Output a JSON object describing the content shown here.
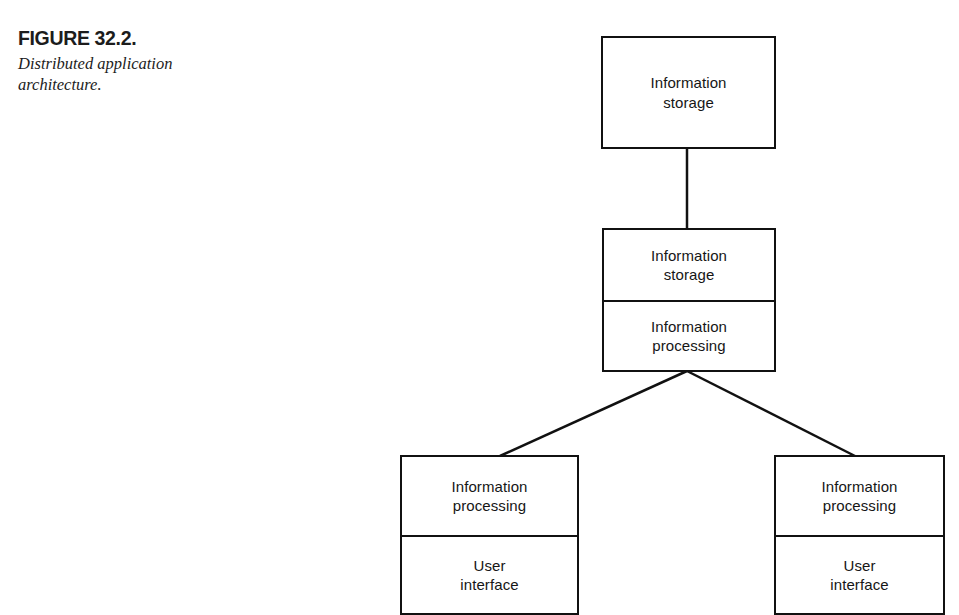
{
  "figure": {
    "label": "FIGURE 32.2.",
    "caption": "Distributed application architecture."
  },
  "diagram": {
    "title": "Distributed application architecture",
    "line_color": "#111111",
    "background": "#ffffff",
    "nodes": [
      {
        "id": "top",
        "name": "information-storage-tier",
        "compartments": [
          {
            "line1": "Information",
            "line2": "storage"
          }
        ]
      },
      {
        "id": "middle",
        "name": "storage-and-processing-tier",
        "compartments": [
          {
            "line1": "Information",
            "line2": "storage"
          },
          {
            "line1": "Information",
            "line2": "processing"
          }
        ]
      },
      {
        "id": "bottom-left",
        "name": "client-tier-left",
        "compartments": [
          {
            "line1": "Information",
            "line2": "processing"
          },
          {
            "line1": "User",
            "line2": "interface"
          }
        ]
      },
      {
        "id": "bottom-right",
        "name": "client-tier-right",
        "compartments": [
          {
            "line1": "Information",
            "line2": "processing"
          },
          {
            "line1": "User",
            "line2": "interface"
          }
        ]
      }
    ],
    "connectors": [
      {
        "name": "connector-top-to-middle",
        "from": "top",
        "to": "middle",
        "kind": "vertical"
      },
      {
        "name": "connector-middle-to-bottom-left",
        "from": "middle",
        "to": "bottom-left",
        "kind": "diagonal"
      },
      {
        "name": "connector-middle-to-bottom-right",
        "from": "middle",
        "to": "bottom-right",
        "kind": "diagonal"
      }
    ]
  }
}
